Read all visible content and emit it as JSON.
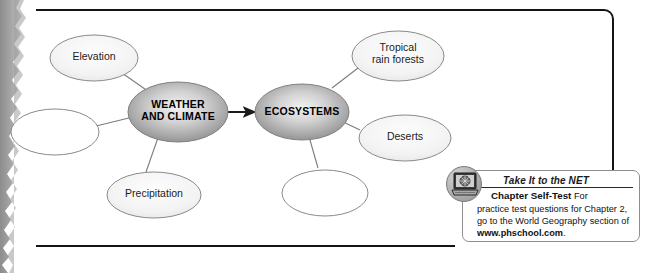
{
  "page": {
    "type": "concept-map-worksheet",
    "frame_border_color": "#141414",
    "background": "#ffffff"
  },
  "concept_map": {
    "core_nodes": [
      {
        "id": "weather-and-climate",
        "label_line1": "WEATHER",
        "label_line2": "AND CLIMATE",
        "filled": true
      },
      {
        "id": "ecosystems",
        "label_line1": "ECOSYSTEMS",
        "label_line2": "",
        "filled": true
      }
    ],
    "leaf_nodes": [
      {
        "id": "elevation",
        "label_line1": "Elevation",
        "label_line2": "",
        "blank": false
      },
      {
        "id": "blank-left",
        "label_line1": "",
        "label_line2": "",
        "blank": true
      },
      {
        "id": "precipitation",
        "label_line1": "Precipitation",
        "label_line2": "",
        "blank": false
      },
      {
        "id": "tropical-rain-forests",
        "label_line1": "Tropical",
        "label_line2": "rain forests",
        "blank": false
      },
      {
        "id": "deserts",
        "label_line1": "Deserts",
        "label_line2": "",
        "blank": false
      },
      {
        "id": "blank-bottom",
        "label_line1": "",
        "label_line2": "",
        "blank": true
      }
    ],
    "connector_arrow": {
      "from": "weather-and-climate",
      "to": "ecosystems",
      "style": "solid-arrow"
    }
  },
  "net_callout": {
    "icon_name": "laptop-globe-icon",
    "title": "Take It to the NET",
    "lead": "Chapter Self-Test",
    "line1_rest": "For",
    "line2": "practice test questions for Chapter 2,",
    "line3": "go to the World Geography section of",
    "url": "www.phschool.com",
    "url_suffix": "."
  }
}
